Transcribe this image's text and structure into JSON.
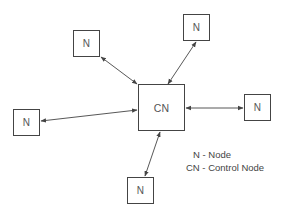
{
  "diagram": {
    "type": "star-topology",
    "nodes": [
      {
        "id": "cn",
        "label": "CN",
        "kind": "control",
        "x": 138,
        "y": 84,
        "w": 47,
        "h": 47
      },
      {
        "id": "n_top_left",
        "label": "N",
        "kind": "node",
        "x": 73,
        "y": 30,
        "w": 27,
        "h": 27
      },
      {
        "id": "n_top_right",
        "label": "N",
        "kind": "node",
        "x": 183,
        "y": 14,
        "w": 27,
        "h": 27
      },
      {
        "id": "n_right",
        "label": "N",
        "kind": "node",
        "x": 244,
        "y": 94,
        "w": 27,
        "h": 27
      },
      {
        "id": "n_left",
        "label": "N",
        "kind": "node",
        "x": 13,
        "y": 109,
        "w": 27,
        "h": 27
      },
      {
        "id": "n_bottom",
        "label": "N",
        "kind": "node",
        "x": 127,
        "y": 177,
        "w": 27,
        "h": 27
      }
    ],
    "edges": [
      {
        "from": "n_top_left",
        "to": "cn",
        "bidirectional": true
      },
      {
        "from": "n_top_right",
        "to": "cn",
        "bidirectional": true
      },
      {
        "from": "cn",
        "to": "n_right",
        "bidirectional": true
      },
      {
        "from": "n_left",
        "to": "cn",
        "bidirectional": true
      },
      {
        "from": "cn",
        "to": "n_bottom",
        "bidirectional": true
      }
    ],
    "legend": {
      "line1": "N - Node",
      "line2": "CN - Control Node"
    }
  },
  "colors": {
    "line": "#444444",
    "text": "#555555",
    "background": "#ffffff"
  }
}
